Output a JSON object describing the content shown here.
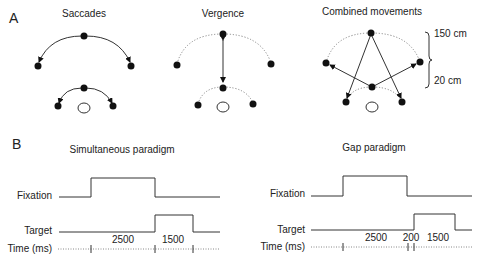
{
  "panel_a": {
    "letter": "A",
    "saccades": {
      "title": "Saccades"
    },
    "vergence": {
      "title": "Vergence"
    },
    "combined": {
      "title": "Combined movements",
      "far_distance": "150 cm",
      "near_distance": "20 cm"
    }
  },
  "panel_b": {
    "letter": "B",
    "simultaneous": {
      "title": "Simultaneous paradigm",
      "fixation_label": "Fixation",
      "target_label": "Target",
      "time_label": "Time (ms)",
      "interval_1": "2500",
      "interval_2": "1500"
    },
    "gap": {
      "title": "Gap paradigm",
      "fixation_label": "Fixation",
      "target_label": "Target",
      "time_label": "Time (ms)",
      "interval_1": "2500",
      "interval_gap": "200",
      "interval_2": "1500"
    }
  },
  "colors": {
    "ink": "#111111",
    "line": "#333333",
    "dotted": "#888888"
  }
}
